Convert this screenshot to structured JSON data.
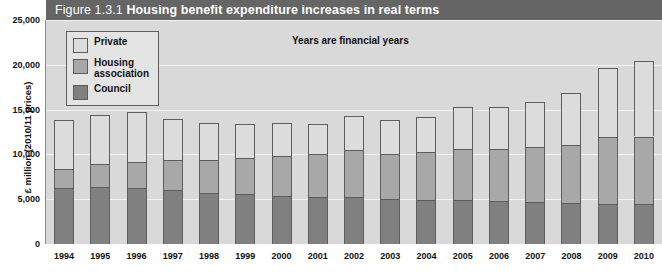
{
  "figure": {
    "number": "Figure 1.3.1",
    "headline": "Housing benefit expenditure increases in real terms",
    "annotation": "Years are financial years",
    "header_color": "#656565",
    "plot_background": "#d9d9d9"
  },
  "legend": {
    "items": [
      {
        "label": "Private",
        "color": "#dcdcdc"
      },
      {
        "label": "Housing\nassociation",
        "color": "#a8a8a8"
      },
      {
        "label": "Council",
        "color": "#808080"
      }
    ]
  },
  "chart_data": {
    "type": "bar",
    "stacked": true,
    "title": "Housing benefit expenditure increases in real terms",
    "subtitle": "Figure 1.3.1",
    "annotation": "Years are financial years",
    "xlabel": "",
    "ylabel": "£ million (2010/11 prices)",
    "ylim": [
      0,
      25000
    ],
    "ytick_step": 5000,
    "ytick_labels": [
      "0",
      "5,000",
      "10,000",
      "15,000",
      "20,000",
      "25,000"
    ],
    "ytick_values": [
      0,
      5000,
      10000,
      15000,
      20000,
      25000
    ],
    "grid": true,
    "legend_position": "top-left",
    "categories": [
      "1994",
      "1995",
      "1996",
      "1997",
      "1998",
      "1999",
      "2000",
      "2001",
      "2002",
      "2003",
      "2004",
      "2005",
      "2006",
      "2007",
      "2008",
      "2009",
      "2010"
    ],
    "series": [
      {
        "name": "Council",
        "color": "#808080",
        "values": [
          6300,
          6400,
          6200,
          6000,
          5700,
          5600,
          5400,
          5300,
          5300,
          5000,
          4900,
          4900,
          4800,
          4700,
          4600,
          4500,
          4500
        ]
      },
      {
        "name": "Housing association",
        "color": "#a8a8a8",
        "values": [
          2100,
          2500,
          3000,
          3400,
          3700,
          4000,
          4400,
          4700,
          5200,
          5100,
          5400,
          5700,
          5800,
          6100,
          6500,
          7400,
          7500
        ]
      },
      {
        "name": "Private",
        "color": "#dcdcdc",
        "values": [
          5400,
          5500,
          5500,
          4600,
          4100,
          3800,
          3700,
          3400,
          3800,
          3700,
          3900,
          4700,
          4700,
          5100,
          5800,
          7800,
          8400
        ]
      }
    ],
    "totals": [
      13800,
      14400,
      14700,
      14000,
      13500,
      13400,
      13500,
      13400,
      14300,
      13800,
      14200,
      15300,
      15300,
      15900,
      16900,
      19700,
      20400
    ]
  },
  "axes": {
    "y_title": "£ million (2010/11 prices)"
  },
  "source_note": ""
}
